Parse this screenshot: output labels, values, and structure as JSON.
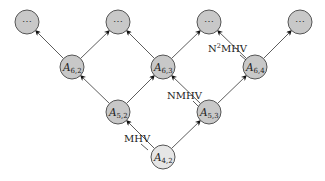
{
  "diagram": {
    "colors": {
      "node_fill": "#c8c8c8",
      "root_fill": "#e6e6e6",
      "stroke": "#555555",
      "edge": "#333333"
    },
    "nodes": [
      {
        "id": "top1",
        "label": "⋯",
        "x": 27,
        "y": 22,
        "kind": "ellipsis"
      },
      {
        "id": "top2",
        "label": "⋯",
        "x": 118,
        "y": 22,
        "kind": "ellipsis"
      },
      {
        "id": "top3",
        "label": "⋯",
        "x": 209,
        "y": 22,
        "kind": "ellipsis"
      },
      {
        "id": "top4",
        "label": "⋯",
        "x": 300,
        "y": 22,
        "kind": "ellipsis"
      },
      {
        "id": "A62",
        "base": "A",
        "sub": "6,2",
        "x": 72,
        "y": 67,
        "kind": "amp"
      },
      {
        "id": "A63",
        "base": "A",
        "sub": "6,3",
        "x": 163,
        "y": 67,
        "kind": "amp"
      },
      {
        "id": "A64",
        "base": "A",
        "sub": "6,4",
        "x": 255,
        "y": 67,
        "kind": "amp"
      },
      {
        "id": "A52",
        "base": "A",
        "sub": "5,2",
        "x": 118,
        "y": 112,
        "kind": "amp"
      },
      {
        "id": "A53",
        "base": "A",
        "sub": "5,3",
        "x": 209,
        "y": 112,
        "kind": "amp"
      },
      {
        "id": "A42",
        "base": "A",
        "sub": "4,2",
        "x": 163,
        "y": 157,
        "kind": "root"
      }
    ],
    "edges": [
      {
        "from": "A42",
        "to": "A52"
      },
      {
        "from": "A42",
        "to": "A53"
      },
      {
        "from": "A52",
        "to": "A62"
      },
      {
        "from": "A52",
        "to": "A63"
      },
      {
        "from": "A53",
        "to": "A63"
      },
      {
        "from": "A53",
        "to": "A64"
      },
      {
        "from": "A62",
        "to": "top1"
      },
      {
        "from": "A62",
        "to": "top2"
      },
      {
        "from": "A63",
        "to": "top2"
      },
      {
        "from": "A63",
        "to": "top3"
      },
      {
        "from": "A64",
        "to": "top3"
      },
      {
        "from": "A64",
        "to": "top4"
      }
    ],
    "labels": {
      "mhv": "MHV",
      "nmhv": "NMHV",
      "n2mhv_base": "N",
      "n2mhv_sup": "2",
      "n2mhv_rest": "MHV"
    }
  }
}
